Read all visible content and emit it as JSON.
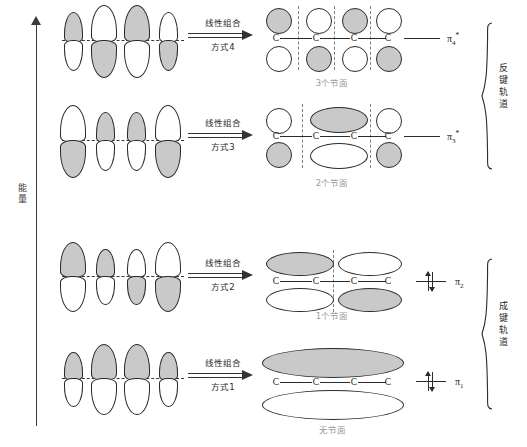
{
  "diagram": {
    "energy_axis_label": "能量",
    "antibonding_brace_label": "反键轨道",
    "bonding_brace_label": "成键轨道"
  },
  "rows": [
    {
      "id": "pi4",
      "arrow_top": "线性组合",
      "arrow_bottom": "方式4",
      "node_count_label": "3个节面",
      "mo_label": "π",
      "mo_sub": "4",
      "mo_sup": "*",
      "occupied": false,
      "atomic_phases_top": [
        "shaded",
        "white",
        "shaded",
        "white"
      ],
      "mo_phases_top": [
        "shaded",
        "white",
        "shaded",
        "white"
      ],
      "nodes": 3,
      "carbons": [
        "C",
        "C",
        "C",
        "C"
      ]
    },
    {
      "id": "pi3",
      "arrow_top": "线性组合",
      "arrow_bottom": "方式3",
      "node_count_label": "2个节面",
      "mo_label": "π",
      "mo_sub": "3",
      "mo_sup": "*",
      "occupied": false,
      "atomic_phases_top": [
        "white",
        "shaded",
        "shaded",
        "white"
      ],
      "mo_phases_top": [
        "white",
        "shaded",
        "white"
      ],
      "nodes": 2,
      "carbons": [
        "C",
        "C",
        "C",
        "C"
      ]
    },
    {
      "id": "pi2",
      "arrow_top": "线性组合",
      "arrow_bottom": "方式2",
      "node_count_label": "1个节面",
      "mo_label": "π",
      "mo_sub": "2",
      "mo_sup": "",
      "occupied": true,
      "atomic_phases_top": [
        "shaded",
        "shaded",
        "white",
        "white"
      ],
      "mo_phases_top": [
        "shaded",
        "white"
      ],
      "nodes": 1,
      "carbons": [
        "C",
        "C",
        "C",
        "C"
      ]
    },
    {
      "id": "pi1",
      "arrow_top": "线性组合",
      "arrow_bottom": "方式1",
      "node_count_label": "无节面",
      "mo_label": "π",
      "mo_sub": "1",
      "mo_sup": "",
      "occupied": true,
      "atomic_phases_top": [
        "shaded",
        "shaded",
        "shaded",
        "shaded"
      ],
      "mo_phases_top": [
        "shaded"
      ],
      "nodes": 0,
      "carbons": [
        "C",
        "C",
        "C",
        "C"
      ]
    }
  ],
  "colors": {
    "shaded_fill": "#c9c9c9",
    "outline": "#2b2b2b",
    "node_dash": "#7d7d7d",
    "node_text": "#9a9a9a",
    "axis": "#3b3b3b"
  }
}
